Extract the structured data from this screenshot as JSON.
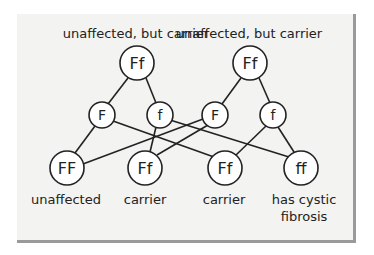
{
  "diagram": {
    "parents": [
      {
        "label": "unaffected, but carrier",
        "genotype": "Ff",
        "gametes": [
          "F",
          "f"
        ]
      },
      {
        "label": "unaffected, but carrier",
        "genotype": "Ff",
        "gametes": [
          "F",
          "f"
        ]
      }
    ],
    "offspring": [
      {
        "genotype": "FF",
        "label_line1": "unaffected",
        "label_line2": ""
      },
      {
        "genotype": "Ff",
        "label_line1": "carrier",
        "label_line2": ""
      },
      {
        "genotype": "Ff",
        "label_line1": "carrier",
        "label_line2": ""
      },
      {
        "genotype": "ff",
        "label_line1": "has cystic",
        "label_line2": "fibrosis"
      }
    ],
    "edges": [
      {
        "from": "parent1",
        "to": "gamete1_F"
      },
      {
        "from": "parent1",
        "to": "gamete1_f"
      },
      {
        "from": "parent2",
        "to": "gamete2_F"
      },
      {
        "from": "parent2",
        "to": "gamete2_f"
      },
      {
        "from": "gamete1_F",
        "to": "offspring_FF"
      },
      {
        "from": "gamete1_F",
        "to": "offspring_Ff_2"
      },
      {
        "from": "gamete1_f",
        "to": "offspring_Ff_1"
      },
      {
        "from": "gamete1_f",
        "to": "offspring_ff"
      },
      {
        "from": "gamete2_F",
        "to": "offspring_FF"
      },
      {
        "from": "gamete2_F",
        "to": "offspring_Ff_1"
      },
      {
        "from": "gamete2_f",
        "to": "offspring_Ff_2"
      },
      {
        "from": "gamete2_f",
        "to": "offspring_ff"
      }
    ],
    "colors": {
      "background": "#f3f3f1",
      "stroke": "#222222",
      "shadow": "#9a9a9a"
    }
  }
}
